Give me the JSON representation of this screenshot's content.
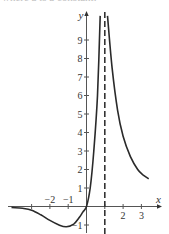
{
  "caption_cut_text": "where a is a constant.",
  "chart_data": {
    "type": "line",
    "title": "",
    "xlabel": "x",
    "ylabel": "y",
    "xlim": [
      -4.1,
      4.1
    ],
    "ylim": [
      -1.4,
      10.5
    ],
    "x_ticks": [
      -3,
      -2,
      -1,
      1,
      2,
      3
    ],
    "x_tick_labels": [
      "",
      "−2",
      "−1",
      "",
      "2",
      "3"
    ],
    "y_ticks": [
      -1,
      1,
      2,
      3,
      4,
      5,
      6,
      7,
      8,
      9
    ],
    "y_tick_labels": [
      "−1",
      "1",
      "2",
      "3",
      "4",
      "5",
      "6",
      "7",
      "8",
      "9"
    ],
    "grid": false,
    "legend": null,
    "vertical_asymptote": {
      "x": 1,
      "style": "dashed"
    },
    "series": [
      {
        "name": "left branch",
        "points": [
          [
            -4.1,
            -0.05
          ],
          [
            -3.5,
            -0.1
          ],
          [
            -3.0,
            -0.2
          ],
          [
            -2.5,
            -0.45
          ],
          [
            -2.0,
            -0.75
          ],
          [
            -1.5,
            -1.0
          ],
          [
            -1.1,
            -1.1
          ],
          [
            -0.7,
            -0.95
          ],
          [
            -0.4,
            -0.6
          ],
          [
            -0.2,
            -0.3
          ],
          [
            0,
            0
          ],
          [
            0.2,
            1.0
          ],
          [
            0.4,
            3.0
          ],
          [
            0.6,
            6.0
          ],
          [
            0.75,
            10.3
          ]
        ]
      },
      {
        "name": "right branch",
        "points": [
          [
            1.15,
            10.3
          ],
          [
            1.4,
            7.5
          ],
          [
            1.7,
            5.2
          ],
          [
            2.0,
            3.8
          ],
          [
            2.4,
            2.7
          ],
          [
            2.8,
            2.0
          ],
          [
            3.1,
            1.7
          ],
          [
            3.4,
            1.5
          ]
        ]
      }
    ]
  }
}
